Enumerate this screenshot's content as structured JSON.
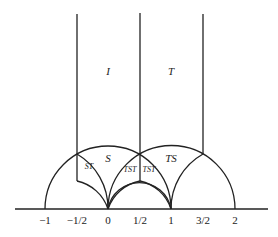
{
  "diagram": {
    "region_labels": [
      {
        "text": "I",
        "x": 108,
        "y": 75,
        "size": 11
      },
      {
        "text": "T",
        "x": 171,
        "y": 75,
        "size": 11
      },
      {
        "text": "S",
        "x": 108,
        "y": 162,
        "size": 11
      },
      {
        "text": "TS",
        "x": 171,
        "y": 162,
        "size": 11
      },
      {
        "text": "ST",
        "x": 89,
        "y": 169,
        "size": 8
      },
      {
        "text": "TST",
        "x": 130,
        "y": 172,
        "size": 8
      },
      {
        "text": "TST",
        "x": 149,
        "y": 172,
        "size": 8
      }
    ],
    "axis_ticks": [
      {
        "text": "−1",
        "x": 45
      },
      {
        "text": "−1/2",
        "x": 77
      },
      {
        "text": "0",
        "x": 108
      },
      {
        "text": "1/2",
        "x": 140
      },
      {
        "text": "1",
        "x": 171
      },
      {
        "text": "3/2",
        "x": 203
      },
      {
        "text": "2",
        "x": 235
      }
    ]
  }
}
